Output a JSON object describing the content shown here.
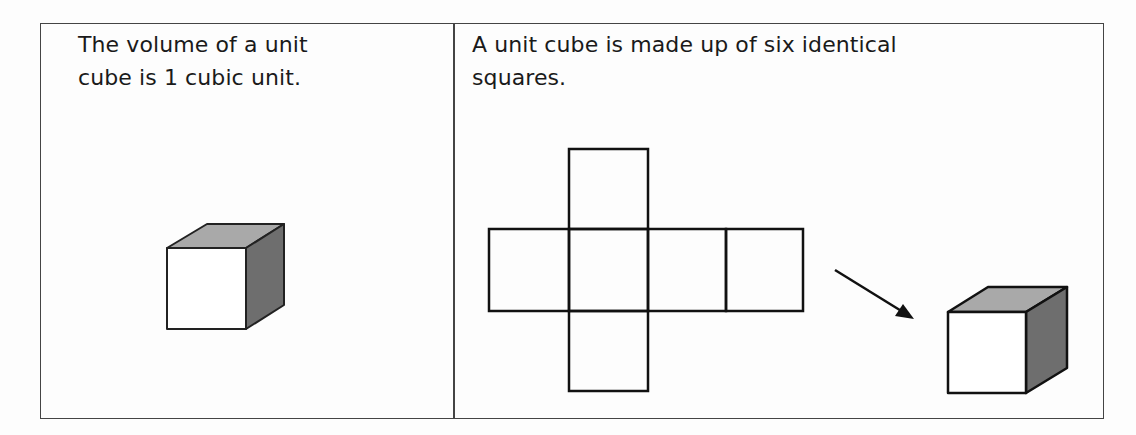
{
  "table": {
    "left_cell": {
      "text_line1": "The volume of a unit",
      "text_line2": "cube is 1 cubic unit.",
      "figure": "unit-cube"
    },
    "right_cell": {
      "text_line1": "A unit cube is made up of six identical",
      "text_line2": "squares.",
      "figures": [
        "cube-net",
        "arrow",
        "unit-cube"
      ]
    }
  },
  "colors": {
    "border": "#444444",
    "line": "#111111",
    "cube_top": "#a9a9a9",
    "cube_side": "#6e6e6e",
    "cube_front": "#ffffff"
  }
}
